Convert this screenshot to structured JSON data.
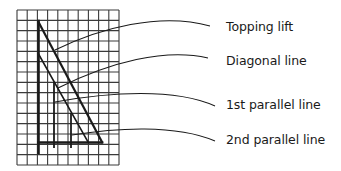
{
  "diagram": {
    "grid": {
      "x0": 17,
      "y0": 10,
      "x1": 119,
      "y1": 165,
      "cols": 10,
      "rows": 15
    },
    "labels": [
      {
        "id": "topping-lift",
        "text": "Topping lift",
        "x": 226,
        "y": 19
      },
      {
        "id": "diagonal-line",
        "text": "Diagonal line",
        "x": 226,
        "y": 53
      },
      {
        "id": "first-parallel-line",
        "text": "1st parallel line",
        "x": 226,
        "y": 97
      },
      {
        "id": "second-parallel-line",
        "text": "2nd parallel line",
        "x": 226,
        "y": 132
      }
    ],
    "colors": {
      "line": "#1a1a1a",
      "grid": "#333333"
    }
  }
}
